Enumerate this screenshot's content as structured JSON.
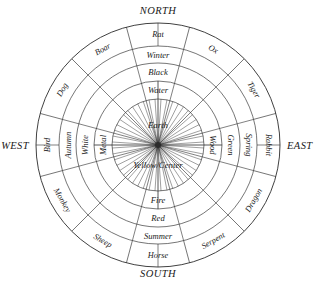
{
  "directions": [
    {
      "name": "north",
      "label": "NORTH"
    },
    {
      "name": "east",
      "label": "EAST"
    },
    {
      "name": "south",
      "label": "SOUTH"
    },
    {
      "name": "west",
      "label": "WEST"
    }
  ],
  "center": {
    "element_label": "Earth",
    "color_label": "Yellow/Center"
  },
  "quadrants": [
    {
      "direction": "NORTH",
      "season": "Winter",
      "color": "Black",
      "element": "Water",
      "animal": "Rat"
    },
    {
      "direction": "EAST",
      "season": "Spring",
      "color": "Green",
      "element": "Wood",
      "animal": "Rabbit"
    },
    {
      "direction": "SOUTH",
      "season": "Summer",
      "color": "Red",
      "element": "Fire",
      "animal": "Horse"
    },
    {
      "direction": "WEST",
      "season": "Autumn",
      "color": "White",
      "element": "Metal",
      "animal": "Bird"
    }
  ],
  "zodiac": [
    {
      "label": "Rat",
      "angle": 0
    },
    {
      "label": "Ox",
      "angle": 30
    },
    {
      "label": "Tiger",
      "angle": 60
    },
    {
      "label": "Rabbit",
      "angle": 90
    },
    {
      "label": "Dragon",
      "angle": 120
    },
    {
      "label": "Serpent",
      "angle": 150
    },
    {
      "label": "Horse",
      "angle": 180
    },
    {
      "label": "Sheep",
      "angle": 210
    },
    {
      "label": "Monkey",
      "angle": 240
    },
    {
      "label": "Bird",
      "angle": 270
    },
    {
      "label": "Dog",
      "angle": 300
    },
    {
      "label": "Boar",
      "angle": 330
    }
  ],
  "rings": {
    "outer_zodiac": [
      "Rat",
      "Ox",
      "Tiger",
      "Rabbit",
      "Dragon",
      "Serpent",
      "Horse",
      "Sheep",
      "Monkey",
      "Bird",
      "Dog",
      "Boar"
    ],
    "season": [
      "Winter",
      "Spring",
      "Summer",
      "Autumn"
    ],
    "color": [
      "Black",
      "Green",
      "Red",
      "White"
    ],
    "element": [
      "Water",
      "Wood",
      "Fire",
      "Metal"
    ]
  },
  "colors": {
    "line": "#2b2b2b",
    "background": "#ffffff",
    "text": "#1a1a1a"
  },
  "geometry": {
    "center_x": 158,
    "center_y": 145,
    "r_outer": 122,
    "r_zodiac_inner": 99,
    "r_season": 82,
    "r_color": 64,
    "r_element": 46,
    "r_hub": 3
  }
}
